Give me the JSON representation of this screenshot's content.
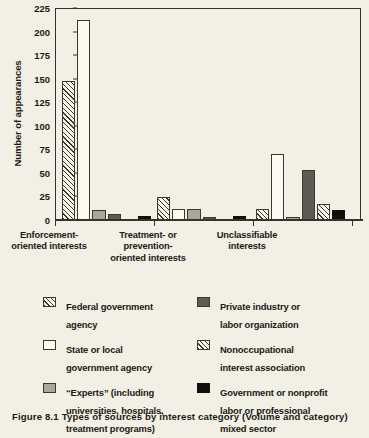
{
  "chart_data": {
    "type": "bar",
    "title": "",
    "xlabel": "",
    "ylabel": "Number of appearances",
    "ylim": [
      0,
      225
    ],
    "ytick_step": 25,
    "yticks": [
      225,
      200,
      175,
      150,
      125,
      100,
      75,
      50,
      25,
      0
    ],
    "grid": false,
    "legend_position": "below",
    "categories": [
      "Enforcement-\noriented interests",
      "Treatment- or\nprevention-\noriented interests",
      "Unclassifiable\ninterests"
    ],
    "series": [
      {
        "name": "Federal government agency",
        "pattern": "diagonal-hatch",
        "color": "#f7f5ea",
        "values": [
          148,
          24,
          12
        ]
      },
      {
        "name": "State or local government agency",
        "pattern": "white-outline",
        "color": "#fbfaf1",
        "values": [
          212,
          12,
          70
        ]
      },
      {
        "name": "“Experts” (including universities, hospitals, treatment programs)",
        "pattern": "light-gray",
        "color": "#a8a79c",
        "values": [
          11,
          12,
          3
        ]
      },
      {
        "name": "Private industry or labor organization",
        "pattern": "dark-gray",
        "color": "#5d5c54",
        "values": [
          6,
          3,
          53
        ]
      },
      {
        "name": "Nonoccupational interest association",
        "pattern": "diagonal-hatch",
        "color": "#f7f5ea",
        "values": [
          0,
          0,
          17
        ]
      },
      {
        "name": "Government or nonprofit labor or professional mixed sector",
        "pattern": "black",
        "color": "#100f0c",
        "values": [
          4,
          4,
          11
        ]
      }
    ]
  },
  "axis": {
    "y_title": "Number of appearances",
    "ticks": [
      "225",
      "200",
      "175",
      "150",
      "125",
      "100",
      "75",
      "50",
      "25",
      "0"
    ]
  },
  "groups": [
    {
      "line1": "Enforcement-",
      "line2": "oriented interests",
      "line3": ""
    },
    {
      "line1": "Treatment- or",
      "line2": "prevention-",
      "line3": "oriented interests"
    },
    {
      "line1": "Unclassifiable",
      "line2": "interests",
      "line3": ""
    }
  ],
  "legend": {
    "left": [
      {
        "swatch": "diagonal-hatch",
        "label": "Federal government\nagency"
      },
      {
        "swatch": "white-outline",
        "label": "State or local\ngovernment agency"
      },
      {
        "swatch": "light-gray",
        "label": "“Experts” (including\nuniversities, hospitals,\ntreatment programs)"
      }
    ],
    "right": [
      {
        "swatch": "dark-gray",
        "label": "Private industry or\nlabor organization"
      },
      {
        "swatch": "diagonal-hatch",
        "label": "Nonoccupational\ninterest association"
      },
      {
        "swatch": "black",
        "label": "Government or nonprofit\nlabor or professional\nmixed sector"
      }
    ]
  },
  "caption": {
    "text": "Figure  8.1  Types  of  sources  by  interest  category  (Volume  and  category)"
  },
  "colors": {
    "page_background": "#f2efe4",
    "ink": "#35332c",
    "hatch_fill": "#f7f5ea",
    "white_fill": "#fbfaf1",
    "light_gray_fill": "#a8a79c",
    "dark_gray_fill": "#5d5c54",
    "black_fill": "#100f0c"
  }
}
